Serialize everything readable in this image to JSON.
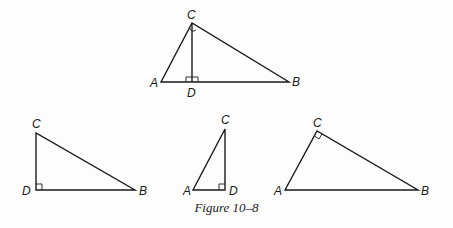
{
  "figure": {
    "caption": "Figure 10–8",
    "triangles": [
      {
        "id": "main",
        "description": "Right triangle ABC with altitude CD to hypotenuse AB",
        "vertices": {
          "A": [
            161,
            82
          ],
          "B": [
            289,
            82
          ],
          "C": [
            192,
            23
          ],
          "D": [
            192,
            82
          ]
        },
        "labels": {
          "A": "A",
          "B": "B",
          "C": "C",
          "D": "D"
        },
        "right_angles": [
          "C",
          "D"
        ]
      },
      {
        "id": "triangle-DBC",
        "vertices": {
          "C": [
            36,
            133
          ],
          "D": [
            36,
            190
          ],
          "B": [
            135,
            190
          ]
        },
        "labels": {
          "C": "C",
          "D": "D",
          "B": "B"
        },
        "right_angles": [
          "D"
        ]
      },
      {
        "id": "triangle-ADC",
        "vertices": {
          "C": [
            225,
            129
          ],
          "A": [
            193,
            190
          ],
          "D": [
            225,
            190
          ]
        },
        "labels": {
          "C": "C",
          "A": "A",
          "D": "D"
        },
        "right_angles": [
          "D"
        ]
      },
      {
        "id": "triangle-ACB",
        "vertices": {
          "A": [
            285,
            190
          ],
          "C": [
            317,
            131
          ],
          "B": [
            418,
            190
          ]
        },
        "labels": {
          "A": "A",
          "C": "C",
          "B": "B"
        },
        "right_angles": [
          "C"
        ]
      }
    ]
  }
}
